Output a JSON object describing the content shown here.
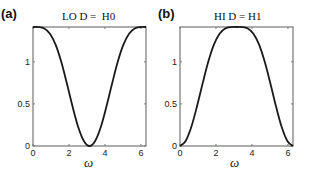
{
  "chart_data": [
    {
      "type": "line",
      "panel_label": "(a)",
      "title": "LO D =  H0",
      "xlabel": "ω",
      "ylabel": "",
      "xlim": [
        0,
        6.2832
      ],
      "ylim": [
        0,
        1.414
      ],
      "xticks": [
        0,
        2,
        4,
        6
      ],
      "yticks": [
        0,
        0.5,
        1
      ],
      "ytick_labels": [
        "0",
        "0.5",
        "1"
      ],
      "grid": false,
      "x": [
        0,
        0.314,
        0.628,
        0.942,
        1.257,
        1.571,
        1.885,
        2.199,
        2.513,
        2.827,
        3.142,
        3.456,
        3.77,
        4.084,
        4.398,
        4.712,
        5.027,
        5.341,
        5.655,
        5.969,
        6.283
      ],
      "series": [
        {
          "name": "LO D",
          "values": [
            1.414,
            1.413,
            1.396,
            1.334,
            1.204,
            1.0,
            0.742,
            0.469,
            0.226,
            0.06,
            0.0,
            0.06,
            0.226,
            0.469,
            0.742,
            1.0,
            1.204,
            1.334,
            1.396,
            1.413,
            1.414
          ]
        }
      ]
    },
    {
      "type": "line",
      "panel_label": "(b)",
      "title": "HI D = H1",
      "xlabel": "ω",
      "ylabel": "",
      "xlim": [
        0,
        6.2832
      ],
      "ylim": [
        0,
        1.414
      ],
      "xticks": [
        0,
        2,
        4,
        6
      ],
      "yticks": [
        0,
        0.5,
        1
      ],
      "ytick_labels": [
        "0",
        "0.5",
        "1"
      ],
      "grid": false,
      "x": [
        0,
        0.314,
        0.628,
        0.942,
        1.257,
        1.571,
        1.885,
        2.199,
        2.513,
        2.827,
        3.142,
        3.456,
        3.77,
        4.084,
        4.398,
        4.712,
        5.027,
        5.341,
        5.655,
        5.969,
        6.283
      ],
      "series": [
        {
          "name": "HI D",
          "values": [
            0.0,
            0.06,
            0.226,
            0.469,
            0.742,
            1.0,
            1.204,
            1.334,
            1.396,
            1.413,
            1.414,
            1.413,
            1.396,
            1.334,
            1.204,
            1.0,
            0.742,
            0.469,
            0.226,
            0.06,
            0.0
          ]
        }
      ]
    }
  ],
  "colors": {
    "line": "#1a1a1a",
    "axis": "#777777"
  }
}
